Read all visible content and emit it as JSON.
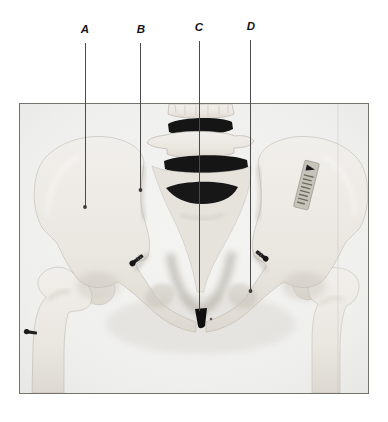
{
  "figure": {
    "labels": [
      "A",
      "B",
      "C",
      "D"
    ]
  },
  "colors": {
    "page_background": "#ffffff",
    "photo_background": "#f0f0ee",
    "frame_border": "#72716b",
    "bone": "#ebe8e2",
    "bone_shadow": "#cfcac1",
    "disc_black": "#151515",
    "leader_line": "#4b4b4b",
    "label_text": "#141414"
  }
}
